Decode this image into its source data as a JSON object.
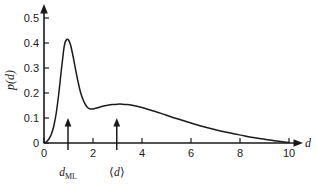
{
  "chart_data": {
    "type": "line",
    "title": "",
    "xlabel": "d",
    "ylabel": "p(d)",
    "xlim": [
      0,
      10.4
    ],
    "ylim": [
      0,
      0.54
    ],
    "grid": false,
    "legend": null,
    "x_ticks": [
      "0",
      "2",
      "4",
      "6",
      "8",
      "10"
    ],
    "x_tick_values": [
      0,
      2,
      4,
      6,
      8,
      10
    ],
    "y_ticks": [
      "0",
      "0.1",
      "0.2",
      "0.3",
      "0.4",
      "0.5"
    ],
    "y_tick_values": [
      0,
      0.1,
      0.2,
      0.3,
      0.4,
      0.5
    ],
    "series": [
      {
        "name": "p(d)",
        "color": "#1a1a1a",
        "x": [
          0.0,
          0.1,
          0.2,
          0.3,
          0.4,
          0.5,
          0.6,
          0.7,
          0.8,
          0.85,
          0.9,
          0.95,
          1.0,
          1.05,
          1.1,
          1.2,
          1.3,
          1.4,
          1.5,
          1.6,
          1.7,
          1.8,
          1.9,
          2.0,
          2.2,
          2.4,
          2.6,
          2.8,
          3.0,
          3.2,
          3.4,
          3.6,
          3.8,
          4.0,
          4.3,
          4.6,
          5.0,
          5.4,
          5.8,
          6.2,
          6.6,
          7.0,
          7.4,
          7.8,
          8.2,
          8.6,
          9.0,
          9.4,
          9.8,
          10.0
        ],
        "y": [
          0.0,
          0.005,
          0.016,
          0.035,
          0.068,
          0.12,
          0.195,
          0.285,
          0.37,
          0.398,
          0.411,
          0.415,
          0.412,
          0.402,
          0.386,
          0.34,
          0.288,
          0.24,
          0.2,
          0.172,
          0.152,
          0.14,
          0.136,
          0.136,
          0.141,
          0.147,
          0.151,
          0.154,
          0.1555,
          0.1555,
          0.154,
          0.151,
          0.147,
          0.142,
          0.133,
          0.124,
          0.111,
          0.098,
          0.086,
          0.074,
          0.063,
          0.053,
          0.044,
          0.036,
          0.028,
          0.021,
          0.015,
          0.009,
          0.004,
          0.002
        ]
      }
    ],
    "annotations": [
      {
        "id": "d-ml",
        "label": "d_ML",
        "label_main": "d",
        "label_sub": "ML",
        "x": 0.98,
        "type": "up-arrow-below-axis"
      },
      {
        "id": "d-mean",
        "label": "⟨d⟩",
        "label_open": "⟨",
        "label_main": "d",
        "label_close": "⟩",
        "x": 2.97,
        "type": "up-arrow-below-axis"
      }
    ],
    "axis_color": "#1a1a1a",
    "curve_color": "#1a1a1a",
    "background": "#ffffff"
  },
  "axes": {
    "x_label": "d",
    "y_label_open": "p(",
    "y_label_var": "d",
    "y_label_close": ")"
  },
  "markers": {
    "dml_var": "d",
    "dml_sub": "ML",
    "mean_open": "⟨",
    "mean_var": "d",
    "mean_close": "⟩"
  }
}
